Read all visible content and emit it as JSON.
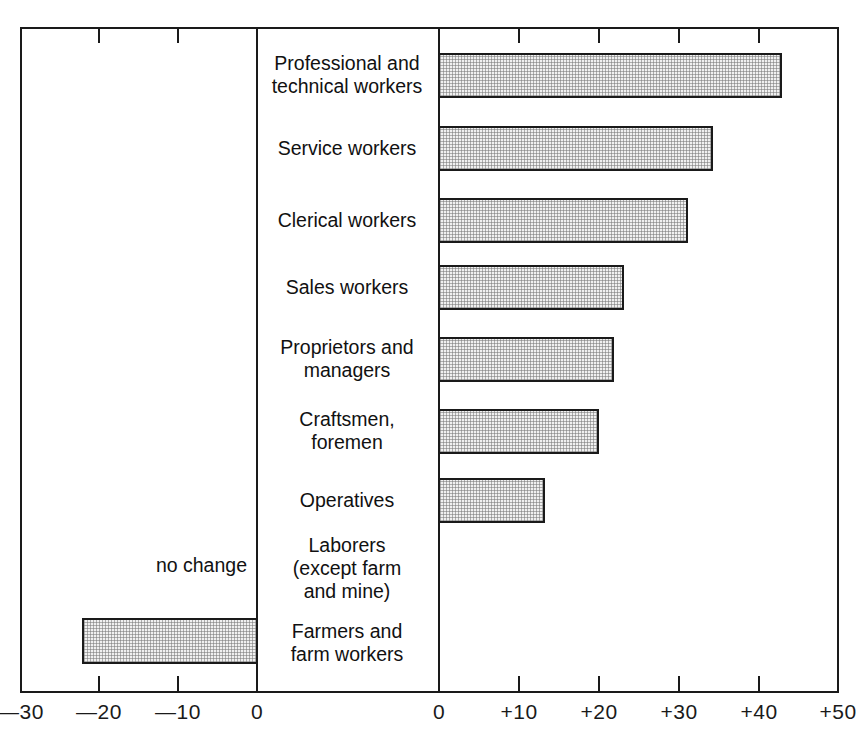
{
  "chart_data": {
    "type": "bar",
    "orientation": "horizontal",
    "title": "",
    "subtitle": "",
    "xlabel": "",
    "ylabel": "",
    "grid": false,
    "legend": null,
    "panels": [
      {
        "name": "decrease-panel",
        "xlim": [
          -30,
          0
        ],
        "ticks": [
          -30,
          -20,
          -10,
          0
        ],
        "tick_labels": [
          "—30",
          "—20",
          "—10",
          "0"
        ]
      },
      {
        "name": "increase-panel",
        "xlim": [
          0,
          50
        ],
        "ticks": [
          0,
          10,
          20,
          30,
          40,
          50
        ],
        "tick_labels": [
          "0",
          "+10",
          "+20",
          "+30",
          "+40",
          "+50"
        ]
      }
    ],
    "categories": [
      "Professional and\ntechnical workers",
      "Service workers",
      "Clerical workers",
      "Sales workers",
      "Proprietors and\nmanagers",
      "Craftsmen,\nforemen",
      "Operatives",
      "Laborers\n(except farm\nand mine)",
      "Farmers and\nfarm workers"
    ],
    "values": [
      42.5,
      34,
      31,
      23,
      21.5,
      20,
      13,
      0,
      -22
    ],
    "value_notes": [
      "",
      "",
      "",
      "",
      "",
      "",
      "",
      "no change",
      ""
    ],
    "annotations": [
      {
        "text": "no change",
        "category": "Laborers\n(except farm\nand mine)"
      }
    ]
  },
  "axis": {
    "left_ticks": [
      {
        "label": "—30",
        "x": 21
      },
      {
        "label": "—20",
        "x": 99
      },
      {
        "label": "—10",
        "x": 178
      },
      {
        "label": "0",
        "x": 257
      }
    ],
    "right_ticks": [
      {
        "label": "0",
        "x": 439
      },
      {
        "label": "+10",
        "x": 519
      },
      {
        "label": "+20",
        "x": 599
      },
      {
        "label": "+30",
        "x": 679
      },
      {
        "label": "+40",
        "x": 759
      },
      {
        "label": "+50",
        "x": 838
      }
    ]
  },
  "rows": [
    {
      "label": "Professional and\ntechnical workers",
      "value": 42.5,
      "center_y": 75,
      "bar_top": 53,
      "bar_height": 45,
      "bar_left": 438,
      "bar_width": 344,
      "direction": "positive"
    },
    {
      "label": "Service workers",
      "value": 34,
      "center_y": 148,
      "bar_top": 126,
      "bar_height": 45,
      "bar_left": 438,
      "bar_width": 275,
      "direction": "positive"
    },
    {
      "label": "Clerical workers",
      "value": 31,
      "center_y": 220,
      "bar_top": 198,
      "bar_height": 45,
      "bar_left": 438,
      "bar_width": 250,
      "direction": "positive"
    },
    {
      "label": "Sales workers",
      "value": 23,
      "center_y": 287,
      "bar_top": 265,
      "bar_height": 45,
      "bar_left": 438,
      "bar_width": 186,
      "direction": "positive"
    },
    {
      "label": "Proprietors and\nmanagers",
      "value": 21.5,
      "center_y": 359,
      "bar_top": 337,
      "bar_height": 45,
      "bar_left": 438,
      "bar_width": 176,
      "direction": "positive"
    },
    {
      "label": "Craftsmen,\nforemen",
      "value": 20,
      "center_y": 431,
      "bar_top": 409,
      "bar_height": 45,
      "bar_left": 438,
      "bar_width": 161,
      "direction": "positive"
    },
    {
      "label": "Operatives",
      "value": 13,
      "center_y": 500,
      "bar_top": 478,
      "bar_height": 45,
      "bar_left": 438,
      "bar_width": 107,
      "direction": "positive"
    },
    {
      "label": "Laborers\n(except farm\nand mine)",
      "value": 0,
      "center_y": 568,
      "bar_top": 0,
      "bar_height": 0,
      "bar_left": 0,
      "bar_width": 0,
      "direction": "none"
    },
    {
      "label": "Farmers and\nfarm workers",
      "value": -22,
      "center_y": 643,
      "bar_top": 618,
      "bar_height": 46,
      "bar_left": 82,
      "bar_width": 176,
      "direction": "negative"
    }
  ],
  "annotation": {
    "no_change": "no change",
    "x": 247,
    "y": 565
  },
  "colors": {
    "bar_fill": "#f0f0f0",
    "bar_stroke": "#1a1a1a",
    "axis": "#1a1a1a",
    "text": "#111111",
    "background": "#ffffff"
  }
}
